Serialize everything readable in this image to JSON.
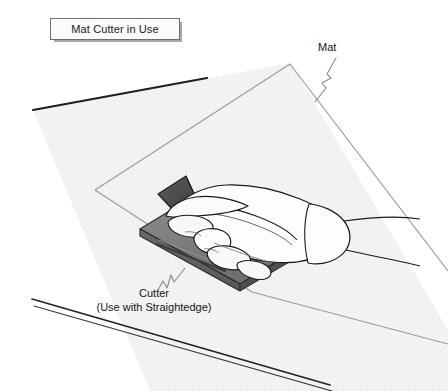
{
  "figure": {
    "title_box": {
      "label": "Mat Cutter in Use"
    },
    "callouts": [
      {
        "id": "mat",
        "lines": [
          "Mat"
        ]
      },
      {
        "id": "cutter",
        "lines": [
          "Cutter",
          "(Use with Straightedge)"
        ]
      }
    ],
    "parts": {
      "worktable": "worktable-surface",
      "mat": "mat-sheet",
      "cutter_body": "cutter-body-slab",
      "cutter_blade_guard": "cutter-blade-guard-triangle",
      "cutter_groove": "cutter-guide-groove",
      "hand": "hand-gripping-cutter",
      "thumb": "thumb",
      "fingers": "fingers",
      "wrist": "wrist-and-forearm"
    }
  },
  "colors": {
    "page_background": "#ffffff",
    "table_fill": "#f2f2f2",
    "table_edge_dark": "#1f1f1f",
    "mat_line": "#8d8d8d",
    "cutter_gray": "#7d7d7d",
    "cutter_dark": "#5a5a5a",
    "blade_guard_dark": "#4a4a4a",
    "hand_fill": "#fdfdfd",
    "outline": "#1a1a1a",
    "leader_line": "#8a8a8a",
    "title_border": "#6e6e6e",
    "title_shadow": "#a8a8a8",
    "text": "#141414"
  }
}
